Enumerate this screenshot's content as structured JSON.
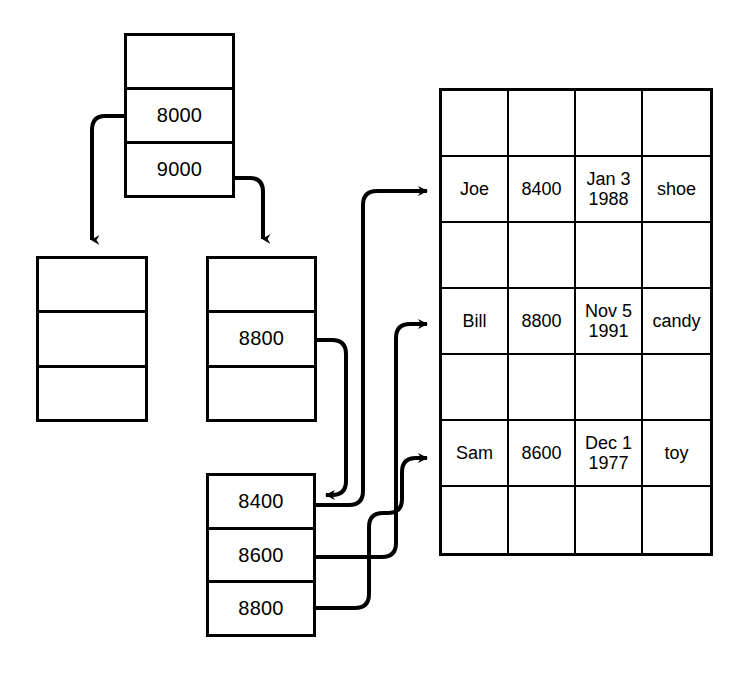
{
  "diagram": {
    "stroke_color": "#000000",
    "background_color": "#ffffff"
  },
  "nodes": {
    "root_box": {
      "name": "root-node",
      "cells": [
        "",
        "8000",
        "9000"
      ]
    },
    "left_box": {
      "name": "left-leaf-node",
      "cells": [
        "",
        "",
        ""
      ]
    },
    "middle_box": {
      "name": "middle-node",
      "cells": [
        "",
        "8800",
        ""
      ]
    },
    "bottom_box": {
      "name": "bottom-leaf-node",
      "cells": [
        "8400",
        "8600",
        "8800"
      ]
    }
  },
  "table": {
    "name": "records-table",
    "columns": 4,
    "rows": [
      {
        "type": "spacer",
        "cells": [
          "",
          "",
          "",
          ""
        ]
      },
      {
        "type": "record",
        "cells": [
          "Joe",
          "8400",
          "Jan 3\n1988",
          "shoe"
        ]
      },
      {
        "type": "spacer",
        "cells": [
          "",
          "",
          "",
          ""
        ]
      },
      {
        "type": "record",
        "cells": [
          "Bill",
          "8800",
          "Nov 5\n1991",
          "candy"
        ]
      },
      {
        "type": "spacer",
        "cells": [
          "",
          "",
          "",
          ""
        ]
      },
      {
        "type": "record",
        "cells": [
          "Sam",
          "8600",
          "Dec 1\n1977",
          "toy"
        ]
      },
      {
        "type": "spacer",
        "cells": [
          "",
          "",
          "",
          ""
        ]
      }
    ]
  },
  "connectors": [
    {
      "name": "root-8000-to-left-node",
      "from": "root_box.cell.8000",
      "to": "left_box.top"
    },
    {
      "name": "root-9000-to-middle-node",
      "from": "root_box.cell.9000",
      "to": "middle_box.top"
    },
    {
      "name": "middle-8800-to-bottom-node",
      "from": "middle_box.cell.8800",
      "to": "bottom_box.cell.8400"
    },
    {
      "name": "bottom-8400-to-joe-row",
      "from": "bottom_box.cell.8400",
      "to": "table.row.Joe"
    },
    {
      "name": "bottom-8600-to-bill-row",
      "from": "bottom_box.cell.8600",
      "to": "table.row.Bill"
    },
    {
      "name": "bottom-8800-to-sam-row",
      "from": "bottom_box.cell.8800",
      "to": "table.row.Sam"
    }
  ]
}
